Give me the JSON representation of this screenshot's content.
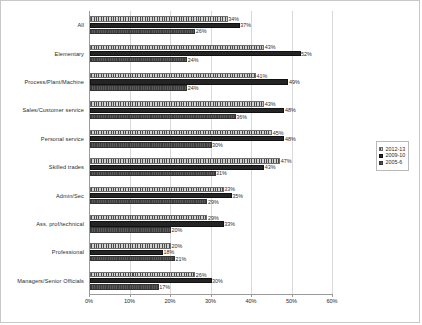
{
  "chart_data": {
    "type": "bar",
    "orientation": "horizontal",
    "title": "",
    "xlabel": "",
    "ylabel": "",
    "xlim": [
      0,
      60
    ],
    "xtick_labels": [
      "0%",
      "10%",
      "20%",
      "30%",
      "40%",
      "50%",
      "60%"
    ],
    "xticks": [
      0,
      10,
      20,
      30,
      40,
      50,
      60
    ],
    "grid": true,
    "legend_position": "right",
    "categories": [
      "All",
      "Elementary",
      "Process/Plant/Machine",
      "Sales/Customer service",
      "Personal service",
      "Skilled trades",
      "Admin/Sec",
      "Ass. prof/technical",
      "Professional",
      "Managers/Senior Officials"
    ],
    "series": [
      {
        "name": "2012-13",
        "values": [
          34,
          43,
          41,
          43,
          45,
          47,
          33,
          29,
          20,
          26
        ],
        "labels": [
          "34%",
          "43%",
          "41%",
          "43%",
          "45%",
          "47%",
          "33%",
          "29%",
          "20%",
          "26%"
        ]
      },
      {
        "name": "2009-10",
        "values": [
          37,
          52,
          49,
          48,
          48,
          43,
          35,
          33,
          18,
          30
        ],
        "labels": [
          "37%",
          "52%",
          "49%",
          "48%",
          "48%",
          "43%",
          "35%",
          "33%",
          "18%",
          "30%"
        ]
      },
      {
        "name": "2005-6",
        "values": [
          26,
          24,
          24,
          36,
          30,
          31,
          29,
          20,
          21,
          17
        ],
        "labels": [
          "26%",
          "24%",
          "24%",
          "36%",
          "30%",
          "31%",
          "29%",
          "20%",
          "21%",
          "17%"
        ]
      }
    ]
  },
  "legend": {
    "items": [
      {
        "label": "2012-13",
        "swatch": "hatched-grey"
      },
      {
        "label": "2009-10",
        "swatch": "solid-black"
      },
      {
        "label": "2005-6",
        "swatch": "solid-dark-grey"
      }
    ]
  },
  "colors": {
    "series_2012_13": "#8e8e8e",
    "series_2009_10": "#242424",
    "series_2005_6": "#4f4f4f",
    "gridline": "#d9d9d9",
    "axis": "#9a9a9a",
    "frame_border": "#c8c8c8",
    "background": "#ffffff"
  }
}
